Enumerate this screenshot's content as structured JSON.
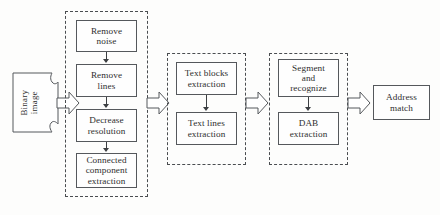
{
  "diagram": {
    "input": {
      "name": "binary-image",
      "label": "Binary\nimage",
      "shape": "document"
    },
    "stages": [
      {
        "name": "preprocessing-stage",
        "steps": [
          {
            "name": "remove-noise",
            "label": "Remove\nnoise"
          },
          {
            "name": "remove-lines",
            "label": "Remove\nlines"
          },
          {
            "name": "decrease-resolution",
            "label": "Decrease\nresolution"
          },
          {
            "name": "connected-component-extraction",
            "label": "Connected\ncomponent\nextraction"
          }
        ]
      },
      {
        "name": "text-extraction-stage",
        "steps": [
          {
            "name": "text-blocks-extraction",
            "label": "Text blocks\nextraction"
          },
          {
            "name": "text-lines-extraction",
            "label": "Text lines\nextraction"
          }
        ]
      },
      {
        "name": "recognition-stage",
        "steps": [
          {
            "name": "segment-and-recognize",
            "label": "Segment\nand\nrecognize"
          },
          {
            "name": "dab-extraction",
            "label": "DAB\nextraction"
          }
        ]
      }
    ],
    "output": {
      "name": "address-match",
      "label": "Address\nmatch"
    },
    "connectors": {
      "block_arrow_count": 4,
      "thin_arrow_count": 5
    },
    "colors": {
      "background": "#fdfdfc",
      "box_border": "#55585c",
      "group_border": "#4a4d50",
      "text": "#2e2e2e",
      "arrow": "#3c3f42"
    }
  }
}
